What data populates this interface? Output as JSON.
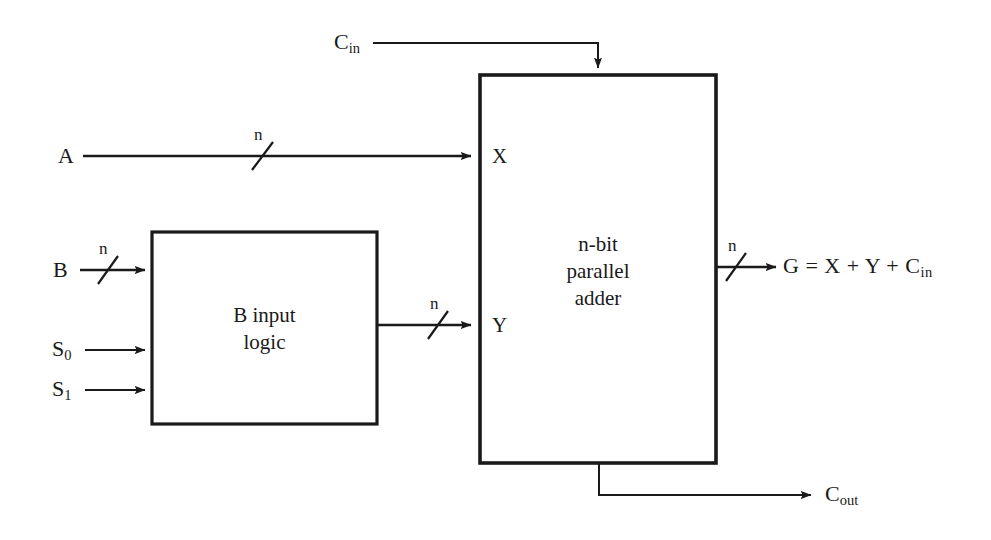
{
  "diagram": {
    "stroke_color": "#1a1a1a",
    "background_color": "#ffffff",
    "blocks": [
      {
        "id": "b-input-logic",
        "line1": "B input",
        "line2": "logic",
        "x": 152,
        "y": 232,
        "w": 225,
        "h": 192
      },
      {
        "id": "parallel-adder",
        "line1": "n-bit",
        "line2": "parallel",
        "line3": "adder",
        "x": 480,
        "y": 75,
        "w": 236,
        "h": 388
      }
    ],
    "labels": {
      "cin": "C",
      "cin_sub": "in",
      "a": "A",
      "b": "B",
      "s0": "S",
      "s0_sub": "0",
      "s1": "S",
      "s1_sub": "1",
      "port_x": "X",
      "port_y": "Y",
      "cout": "C",
      "cout_sub": "out",
      "bus_width": "n",
      "output_equation": "G = X + Y + C",
      "output_equation_sub": "in"
    },
    "bus_markers": [
      {
        "id": "a-bus-width",
        "label": "n"
      },
      {
        "id": "b-bus-width",
        "label": "n"
      },
      {
        "id": "y-bus-width",
        "label": "n"
      },
      {
        "id": "g-bus-width",
        "label": "n"
      }
    ]
  }
}
